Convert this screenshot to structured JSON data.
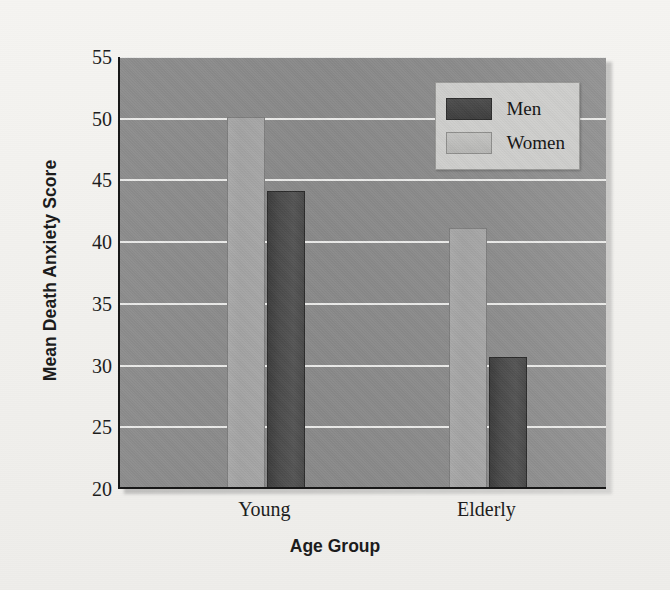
{
  "chart_data": {
    "type": "bar",
    "title": "",
    "xlabel": "Age Group",
    "ylabel": "Mean Death Anxiety Score",
    "categories": [
      "Young",
      "Elderly"
    ],
    "series": [
      {
        "name": "Men",
        "values": [
          44.0,
          30.5
        ],
        "color": "#4a4a4a"
      },
      {
        "name": "Women",
        "values": [
          50.0,
          41.0
        ],
        "color": "#a6a6a6"
      }
    ],
    "ylim": [
      20,
      55
    ],
    "yticks": [
      20,
      25,
      30,
      35,
      40,
      45,
      50,
      55
    ],
    "ytick_labels": [
      "20",
      "25",
      "30",
      "35",
      "40",
      "45",
      "50",
      "55"
    ],
    "grid": true,
    "grid_color": "#f0f0ee",
    "legend_position": "top-right",
    "legend_entries": [
      "Men",
      "Women"
    ],
    "plot_background": "#8a8a8a",
    "page_background": "#f3f2ef"
  }
}
